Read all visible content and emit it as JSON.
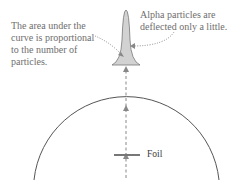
{
  "annotations": {
    "area_note": "The area under the curve is proportional to the number of particles.",
    "deflection_note": "Alpha particles are deflected only a little.",
    "foil_label": "Foil"
  },
  "colors": {
    "text": "#6e6e6e",
    "circle": "#555555",
    "peak_fill": "#cfcfcf",
    "beam": "#888888"
  }
}
